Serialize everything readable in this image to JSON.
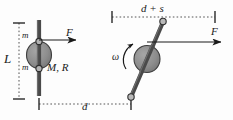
{
  "figure": {
    "colors": {
      "rod": "#4a4a4a",
      "disk_fill": "#8c8c8c",
      "disk_stroke": "#3d3d3d",
      "line": "#1a1a1a",
      "dashed": "#555555",
      "background": "#fdfdfd"
    },
    "labels": {
      "length_L": "L",
      "mass_top": "m",
      "mass_bottom": "m",
      "disk_MR": "M, R",
      "force_left": "F",
      "force_right": "F",
      "distance_d": "d",
      "distance_d_plus_s": "d + s",
      "angular_velocity": "ω"
    },
    "panels": [
      {
        "name": "initial-state",
        "description": "vertical rod with disk at center, two point masses m, force F applied horizontally to the right",
        "elements": [
          "rod",
          "disk",
          "mass-top",
          "mass-bottom",
          "force-arrow",
          "length-dimension-L",
          "distance-dimension-d"
        ]
      },
      {
        "name": "rotated-state",
        "description": "tilted rod with disk, rotating counterclockwise with angular velocity omega, force F applied horizontally to the right",
        "elements": [
          "rod",
          "disk",
          "end-cap-top",
          "end-cap-bottom",
          "force-arrow",
          "omega-arc-arrow",
          "distance-dimension-d-plus-s"
        ]
      }
    ]
  }
}
